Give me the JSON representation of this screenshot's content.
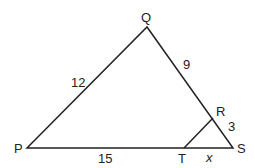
{
  "diagram": {
    "type": "triangle",
    "vertices": {
      "P": {
        "label": "P",
        "x": 27,
        "y": 148
      },
      "Q": {
        "label": "Q",
        "x": 147,
        "y": 27
      },
      "S": {
        "label": "S",
        "x": 233,
        "y": 148
      },
      "R": {
        "label": "R",
        "x": 213,
        "y": 118
      },
      "T": {
        "label": "T",
        "x": 184,
        "y": 148
      }
    },
    "segments": {
      "PQ": {
        "label": "12"
      },
      "QR": {
        "label": "9"
      },
      "RS": {
        "label": "3"
      },
      "PT": {
        "label": "15"
      },
      "TS": {
        "label": "x"
      }
    }
  }
}
